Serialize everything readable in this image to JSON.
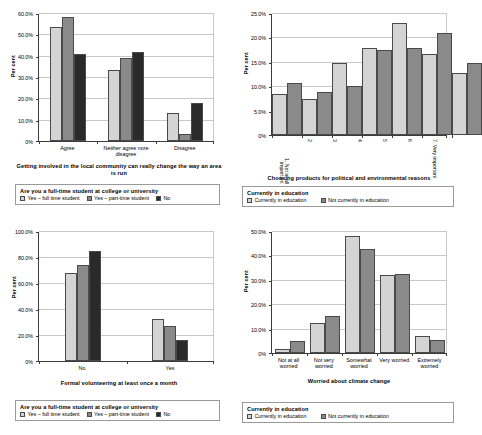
{
  "charts": [
    {
      "id": "community-involvement",
      "ylabel": "Per cent",
      "xtitle": "Getting involved in the local community can really change the way an area is run",
      "yticks": [
        "0%",
        "10.0%",
        "20.0%",
        "30.0%",
        "40.0%",
        "50.0%",
        "60.0%"
      ],
      "legend_title": "Are you a full-time student at college or university",
      "chart_data": {
        "type": "bar",
        "title": "Getting involved in the local community can really change the way an area is run",
        "xlabel": "Getting involved in the local community can really change the way an area is run",
        "ylabel": "Per cent",
        "ylim": [
          0,
          60
        ],
        "grid": true,
        "legend_position": "below",
        "categories": [
          "Agree",
          "Neither agree nore disagree",
          "Disagree"
        ],
        "series": [
          {
            "name": "Yes – full time student",
            "color": "#d4d4d4",
            "values": [
              53.5,
              33.4,
              13.2
            ]
          },
          {
            "name": "Yes – part-time student",
            "color": "#8a8a8a",
            "values": [
              58.2,
              38.8,
              3.2
            ]
          },
          {
            "name": "No",
            "color": "#2a2a2a",
            "values": [
              40.7,
              41.6,
              17.6
            ]
          }
        ]
      }
    },
    {
      "id": "choosing-products",
      "ylabel": "Per cent",
      "xtitle": "Choosing products for political and environmental reasons",
      "yticks": [
        "0%",
        "5.0%",
        "10.0%",
        "15.0%",
        "20.0%",
        "25.0%"
      ],
      "legend_title": "Currently in education",
      "chart_data": {
        "type": "bar",
        "title": "Choosing products for political and environmental reasons",
        "xlabel": "Choosing products for political and environmental reasons",
        "ylabel": "Per cent",
        "ylim": [
          0,
          25
        ],
        "grid": true,
        "legend_position": "below",
        "categories": [
          "1. Not at all important",
          "2",
          "3",
          "4",
          "5",
          "6",
          "7. Very important"
        ],
        "series": [
          {
            "name": "Currently in education",
            "color": "#d4d4d4",
            "values": [
              8.4,
              7.4,
              14.7,
              17.8,
              22.9,
              16.6,
              12.7
            ]
          },
          {
            "name": "Not currently in education",
            "color": "#8a8a8a",
            "values": [
              10.7,
              8.9,
              10.0,
              17.5,
              17.8,
              20.9,
              14.7
            ]
          }
        ]
      }
    },
    {
      "id": "formal-volunteering",
      "ylabel": "Per cent",
      "xtitle": "Formal volunteering at least once a month",
      "yticks": [
        "0%",
        "20.0%",
        "40.0%",
        "60.0%",
        "80.0%",
        "100.0%"
      ],
      "legend_title": "Are you a full-time student at college or university",
      "chart_data": {
        "type": "bar",
        "title": "Formal volunteering at least once a month",
        "xlabel": "Formal volunteering at least once a month",
        "ylabel": "Per cent",
        "ylim": [
          0,
          100
        ],
        "grid": true,
        "legend_position": "below",
        "categories": [
          "No",
          "Yes"
        ],
        "series": [
          {
            "name": "Yes – full time student",
            "color": "#d4d4d4",
            "values": [
              67.5,
              32.5
            ]
          },
          {
            "name": "Yes – part-time student",
            "color": "#8a8a8a",
            "values": [
              73.8,
              26.6
            ]
          },
          {
            "name": "No",
            "color": "#2a2a2a",
            "values": [
              84.5,
              15.8
            ]
          }
        ]
      }
    },
    {
      "id": "climate-change-worry",
      "ylabel": "Per cent",
      "xtitle": "Worried about climate change",
      "yticks": [
        "0%",
        "10.0%",
        "20.0%",
        "30.0%",
        "40.0%",
        "50.0%"
      ],
      "legend_title": "Currently in education",
      "chart_data": {
        "type": "bar",
        "title": "Worried about climate change",
        "xlabel": "Worried about climate change",
        "ylabel": "Per cent",
        "ylim": [
          0,
          50
        ],
        "grid": true,
        "legend_position": "below",
        "categories": [
          "Not at all worried",
          "Not very worried",
          "Somewhat worried",
          "Very worried",
          "Extremely worried"
        ],
        "series": [
          {
            "name": "Currently in education",
            "color": "#d4d4d4",
            "values": [
              1.8,
              12.1,
              47.8,
              31.8,
              6.9
            ]
          },
          {
            "name": "Not currently in education",
            "color": "#8a8a8a",
            "values": [
              5.0,
              15.3,
              42.6,
              32.2,
              5.3
            ]
          }
        ]
      }
    }
  ]
}
